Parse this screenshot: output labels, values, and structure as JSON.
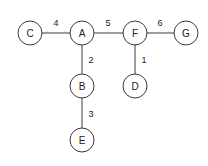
{
  "diagram": {
    "type": "weighted-graph",
    "style": {
      "stroke": "#3a3a3a",
      "node_fill": "#ffffff",
      "text_color": "#222222",
      "background": "#ffffff"
    },
    "nodes": [
      {
        "id": "A",
        "label": "A",
        "x": 82,
        "y": 33
      },
      {
        "id": "B",
        "label": "B",
        "x": 82,
        "y": 86
      },
      {
        "id": "C",
        "label": "C",
        "x": 30,
        "y": 33
      },
      {
        "id": "D",
        "label": "D",
        "x": 135,
        "y": 86
      },
      {
        "id": "E",
        "label": "E",
        "x": 82,
        "y": 140
      },
      {
        "id": "F",
        "label": "F",
        "x": 135,
        "y": 33
      },
      {
        "id": "G",
        "label": "G",
        "x": 186,
        "y": 33
      }
    ],
    "edges": [
      {
        "from": "C",
        "to": "A",
        "weight": "4",
        "label_x": 56,
        "label_y": 26
      },
      {
        "from": "A",
        "to": "F",
        "weight": "5",
        "label_x": 108,
        "label_y": 26
      },
      {
        "from": "F",
        "to": "G",
        "weight": "6",
        "label_x": 160,
        "label_y": 26
      },
      {
        "from": "A",
        "to": "B",
        "weight": "2",
        "label_x": 91,
        "label_y": 63
      },
      {
        "from": "F",
        "to": "D",
        "weight": "1",
        "label_x": 144,
        "label_y": 63
      },
      {
        "from": "B",
        "to": "E",
        "weight": "3",
        "label_x": 91,
        "label_y": 117
      }
    ]
  }
}
